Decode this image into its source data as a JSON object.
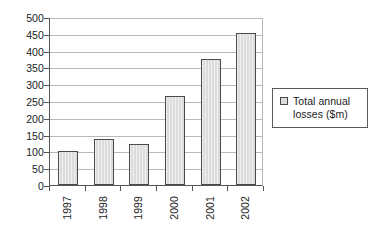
{
  "chart_data": {
    "type": "bar",
    "title": "",
    "xlabel": "",
    "ylabel": "",
    "categories": [
      "1997",
      "1998",
      "1999",
      "2000",
      "2001",
      "2002"
    ],
    "values": [
      100,
      138,
      123,
      265,
      375,
      453
    ],
    "series": [
      {
        "name": "Total annual losses ($m)",
        "values": [
          100,
          138,
          123,
          265,
          375,
          453
        ]
      }
    ],
    "ylim": [
      0,
      500
    ],
    "yticks": [
      0,
      50,
      100,
      150,
      200,
      250,
      300,
      350,
      400,
      450,
      500
    ],
    "ytick_labels": [
      "0",
      "50",
      "100",
      "150",
      "200",
      "250",
      "300",
      "350",
      "400",
      "450",
      "500"
    ],
    "grid": true,
    "legend_position": "right",
    "legend_entries": [
      "Total annual losses ($m)"
    ],
    "annotations": [],
    "colors": {
      "bar_fill": "#dcdcdc",
      "bar_border": "#4a4a4a",
      "gridline": "#b9b9b9",
      "axis": "#555555",
      "text": "#1a1a1a",
      "background": "#ffffff"
    }
  },
  "legend": {
    "label_line1": "Total annual",
    "label_line2": "losses ($m)",
    "swatch_name": "legend-swatch-total-annual-losses"
  }
}
